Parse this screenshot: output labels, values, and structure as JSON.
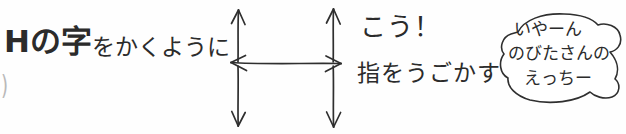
{
  "panel": {
    "width": 626,
    "height": 134,
    "background_color": "#fefefe",
    "ink_color": "#2b2b2b",
    "faint_ink_color": "#b9b9b9"
  },
  "captions": {
    "left": {
      "heavy_part": "Hの字",
      "light_part": "をかくように",
      "full_text": "Hの字をかくように"
    },
    "left_fragment": ")",
    "right_top": "こう！",
    "right_bottom": "指をうごかす"
  },
  "diagram": {
    "name": "h-shaped-arrow-diagram",
    "arrows": [
      {
        "id": "left-vertical",
        "orientation": "vertical",
        "double_headed": true
      },
      {
        "id": "right-vertical",
        "orientation": "vertical",
        "double_headed": true
      },
      {
        "id": "horizontal-connector",
        "orientation": "horizontal",
        "double_headed": true
      }
    ]
  },
  "speech_bubble": {
    "shape": "irregular-hand-drawn-blob",
    "lines": [
      "いやーん",
      "のびたさんの",
      "えっちー"
    ]
  }
}
